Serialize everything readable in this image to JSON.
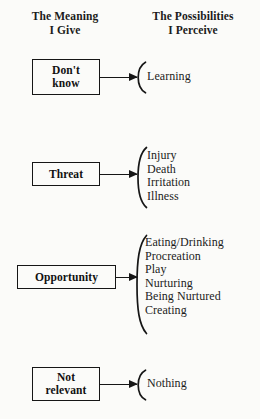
{
  "diagram": {
    "headers": {
      "left": "The Meaning\nI Give",
      "left_line1": "The Meaning",
      "left_line2": "I Give",
      "right": "The Possibilities\nI Perceive",
      "right_line1": "The Possibilities",
      "right_line2": "I Perceive"
    },
    "colors": {
      "ink": "#161616",
      "paper": "#fbfbf9"
    },
    "rows": [
      {
        "meaning_line1": "Don't",
        "meaning_line2": "know",
        "meaning_label": "Don't know",
        "possibilities": [
          "Learning"
        ]
      },
      {
        "meaning_line1": "Threat",
        "meaning_line2": "",
        "meaning_label": "Threat",
        "possibilities": [
          "Injury",
          "Death",
          "Irritation",
          "Illness"
        ]
      },
      {
        "meaning_line1": "Opportunity",
        "meaning_line2": "",
        "meaning_label": "Opportunity",
        "possibilities": [
          "Eating/Drinking",
          "Procreation",
          "Play",
          "Nurturing",
          "Being Nurtured",
          "Creating"
        ]
      },
      {
        "meaning_line1": "Not",
        "meaning_line2": "relevant",
        "meaning_label": "Not relevant",
        "possibilities": [
          "Nothing"
        ]
      }
    ]
  }
}
